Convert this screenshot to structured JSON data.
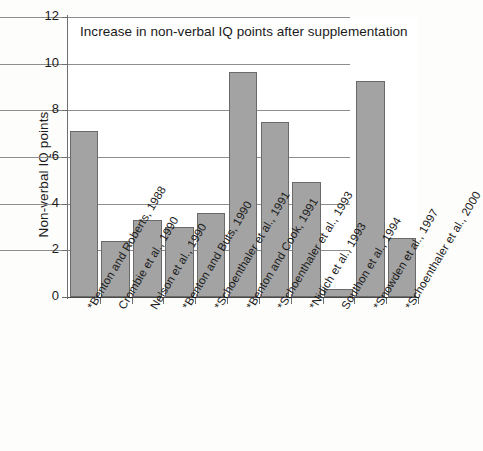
{
  "chart_data": {
    "type": "bar",
    "title": "Increase in non-verbal IQ points after supplementation",
    "xlabel": "",
    "ylabel": "Non-verbal IQ points",
    "ylim": [
      0,
      12
    ],
    "yticks": [
      "0",
      "2",
      "4",
      "6",
      "8",
      "10",
      "12"
    ],
    "grid": true,
    "legend": "none",
    "bar_color": "#a3a3a3",
    "bar_edge_color": "#6a6a6a",
    "categories": [
      "*Benton and Roberts, 1988",
      "Crombie et al., 1990",
      "Nelson et al., 1990",
      "*Benton and Buts, 1990",
      "*Schoenthaler et al., 1991",
      "*Benton and Cook, 1991",
      "*Schoenthaler et al., 1993",
      "*Nidich et al., 1993",
      "Southon et al., 1994",
      "*Snowden et al., 1997",
      "*Schoenthaler et al., 2000"
    ],
    "values": [
      7.1,
      2.4,
      3.3,
      3.0,
      3.6,
      9.65,
      7.5,
      4.95,
      0.35,
      9.25,
      2.55
    ]
  }
}
